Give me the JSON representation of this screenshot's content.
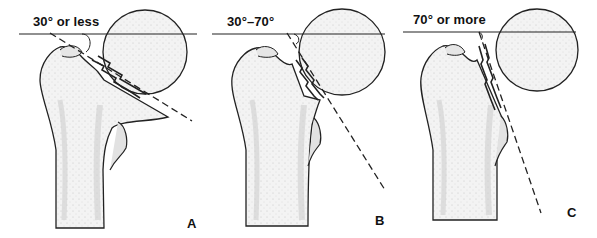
{
  "figure": {
    "panels": [
      {
        "id": "A",
        "title": "30° or less",
        "letter": "A"
      },
      {
        "id": "B",
        "title": "30°–70°",
        "letter": "B"
      },
      {
        "id": "C",
        "title": "70° or more",
        "letter": "C"
      }
    ]
  },
  "colors": {
    "background": "#ffffff",
    "ink": "#111111",
    "bone_fill": "#f2f2f2",
    "bone_shade": "#d6d6d6"
  }
}
